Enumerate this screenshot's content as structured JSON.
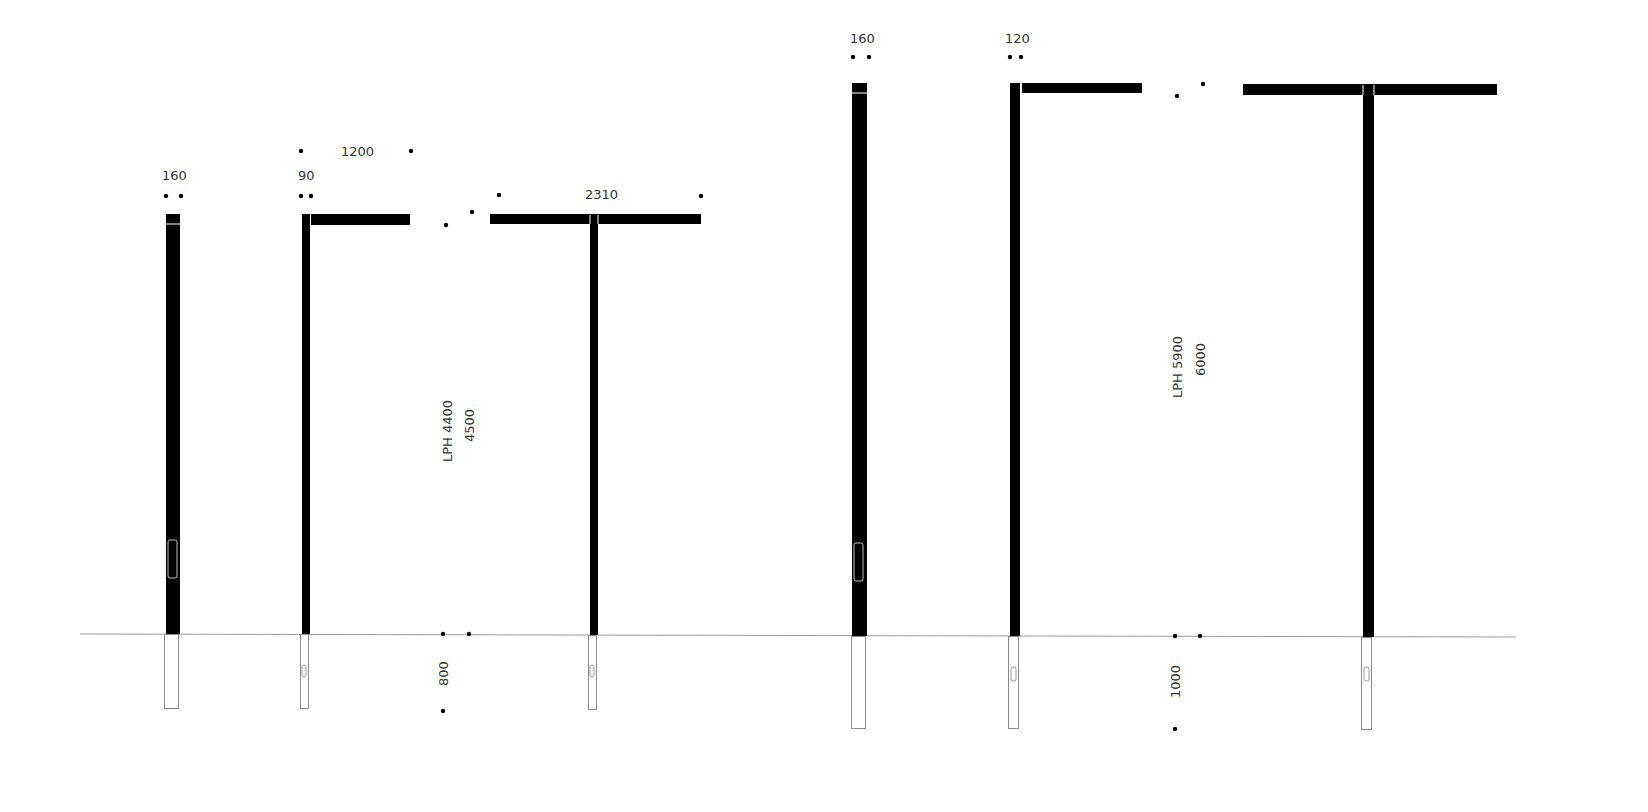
{
  "drawing": {
    "type": "light pole elevation drawing",
    "colors": {
      "pole": "#000000",
      "ground_line": "#9a9a9a",
      "text": "#333333",
      "background": "#ffffff"
    },
    "group_small": {
      "height_labels": {
        "lph": "LPH 4400",
        "total": "4500"
      },
      "foundation_depth": "800",
      "poles": [
        {
          "id": "straight-pole-small",
          "type": "straight",
          "diameter_label": "160"
        },
        {
          "id": "single-arm-pole-small",
          "type": "single-arm",
          "diameter_label": "90",
          "arm_length_label": "1200"
        },
        {
          "id": "double-arm-pole-small",
          "type": "double-arm",
          "arm_span_label": "2310"
        }
      ]
    },
    "group_large": {
      "height_labels": {
        "lph": "LPH 5900",
        "total": "6000"
      },
      "foundation_depth": "1000",
      "poles": [
        {
          "id": "straight-pole-large",
          "type": "straight",
          "diameter_label": "160"
        },
        {
          "id": "single-arm-pole-large",
          "type": "single-arm",
          "diameter_label": "120"
        },
        {
          "id": "double-arm-pole-large",
          "type": "double-arm"
        }
      ]
    }
  }
}
